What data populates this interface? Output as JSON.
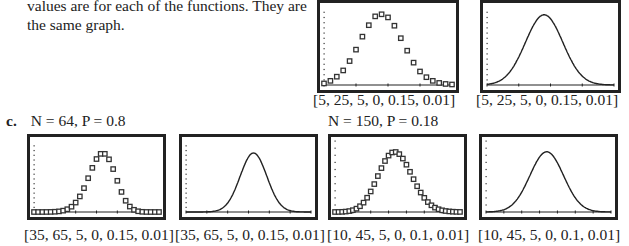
{
  "text": {
    "paragraph": "values are for each of the functions. They are the same graph.",
    "part_c_marker": "c.",
    "part_c_left_condition": "N = 64, P = 0.8",
    "part_c_right_condition": "N = 150, P = 0.18"
  },
  "chart_data": [
    {
      "type": "scatter",
      "title": "",
      "window_label": "[5, 25, 5, 0, 0.15, 0.01]",
      "xlim": [
        5,
        25
      ],
      "xscl": 5,
      "ylim": [
        0,
        0.15
      ],
      "yscl": 0.01,
      "x": [
        5,
        6,
        7,
        8,
        9,
        10,
        11,
        12,
        13,
        14,
        15,
        16,
        17,
        18,
        19,
        20,
        21,
        22,
        23,
        24,
        25
      ],
      "y": [
        0.003,
        0.008,
        0.016,
        0.028,
        0.046,
        0.068,
        0.093,
        0.115,
        0.132,
        0.136,
        0.13,
        0.114,
        0.09,
        0.066,
        0.043,
        0.026,
        0.015,
        0.008,
        0.004,
        0.002,
        0.001
      ]
    },
    {
      "type": "line",
      "window_label": "[5, 25, 5, 0, 0.15, 0.01]",
      "xlim": [
        5,
        25
      ],
      "xscl": 5,
      "ylim": [
        0,
        0.15
      ],
      "yscl": 0.01,
      "mean": 14,
      "sd": 2.95,
      "peak": 0.135
    },
    {
      "type": "scatter",
      "condition": "N = 64, P = 0.8",
      "window_label": "[35, 65, 5, 0, 0.15, 0.01]",
      "xlim": [
        35,
        65
      ],
      "xscl": 5,
      "ylim": [
        0,
        0.15
      ],
      "yscl": 0.01,
      "N": 64,
      "P": 0.8
    },
    {
      "type": "line",
      "condition": "N = 64, P = 0.8",
      "window_label": "[35, 65, 5, 0, 0.15, 0.01]",
      "xlim": [
        35,
        65
      ],
      "xscl": 5,
      "ylim": [
        0,
        0.15
      ],
      "yscl": 0.01,
      "mean": 51.2,
      "sd": 3.2
    },
    {
      "type": "scatter",
      "condition": "N = 150, P = 0.18",
      "window_label": "[10, 45, 5, 0, 0.1, 0.01]",
      "xlim": [
        10,
        45
      ],
      "xscl": 5,
      "ylim": [
        0,
        0.1
      ],
      "yscl": 0.01,
      "N": 150,
      "P": 0.18
    },
    {
      "type": "line",
      "condition": "N = 150, P = 0.18",
      "window_label": "[10, 45, 5, 0, 0.1, 0.01]",
      "xlim": [
        10,
        45
      ],
      "xscl": 5,
      "ylim": [
        0,
        0.1
      ],
      "yscl": 0.01,
      "mean": 27,
      "sd": 4.705
    }
  ]
}
